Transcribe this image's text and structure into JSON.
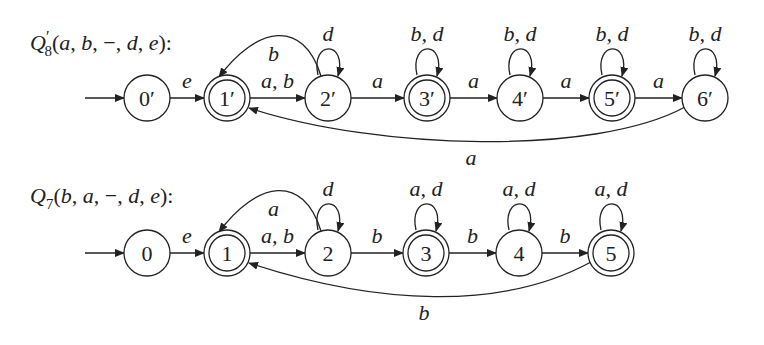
{
  "automata": [
    {
      "id": "top",
      "title": "Q′8(a, b, −, d, e):",
      "title_parts": {
        "name": "Q",
        "sup": "′",
        "sub": "8",
        "args": "(a, b, −, d, e):"
      },
      "title_pos": [
        30,
        50
      ],
      "cy": 98,
      "states": [
        {
          "label": "0′",
          "x": 147,
          "accepting": false,
          "initial": true
        },
        {
          "label": "1′",
          "x": 227,
          "accepting": true,
          "initial": false
        },
        {
          "label": "2′",
          "x": 328,
          "accepting": false,
          "initial": false
        },
        {
          "label": "3′",
          "x": 427,
          "accepting": true,
          "initial": false
        },
        {
          "label": "4′",
          "x": 520,
          "accepting": false,
          "initial": false
        },
        {
          "label": "5′",
          "x": 612,
          "accepting": true,
          "initial": false
        },
        {
          "label": "6′",
          "x": 705,
          "accepting": false,
          "initial": false
        }
      ],
      "transitions": [
        {
          "from": 0,
          "to": 1,
          "label": "e"
        },
        {
          "from": 1,
          "to": 2,
          "label": "a, b"
        },
        {
          "from": 2,
          "to": 3,
          "label": "a"
        },
        {
          "from": 3,
          "to": 4,
          "label": "a"
        },
        {
          "from": 4,
          "to": 5,
          "label": "a"
        },
        {
          "from": 5,
          "to": 6,
          "label": "a"
        }
      ],
      "back_arc_short": {
        "from": 2,
        "to": 1,
        "label": "b"
      },
      "back_arc_long": {
        "from": 6,
        "to": 1,
        "label": "a"
      },
      "self_loops": [
        {
          "state": 2,
          "label": "d"
        },
        {
          "state": 3,
          "label": "b, d"
        },
        {
          "state": 4,
          "label": "b, d"
        },
        {
          "state": 5,
          "label": "b, d"
        },
        {
          "state": 6,
          "label": "b, d"
        }
      ]
    },
    {
      "id": "bottom",
      "title": "Q7(b, a, −, d, e):",
      "title_parts": {
        "name": "Q",
        "sup": "",
        "sub": "7",
        "args": "(b, a, −, d, e):"
      },
      "title_pos": [
        30,
        203
      ],
      "cy": 253,
      "states": [
        {
          "label": "0",
          "x": 147,
          "accepting": false,
          "initial": true
        },
        {
          "label": "1",
          "x": 227,
          "accepting": true,
          "initial": false
        },
        {
          "label": "2",
          "x": 328,
          "accepting": false,
          "initial": false
        },
        {
          "label": "3",
          "x": 426,
          "accepting": true,
          "initial": false
        },
        {
          "label": "4",
          "x": 519,
          "accepting": false,
          "initial": false
        },
        {
          "label": "5",
          "x": 611,
          "accepting": true,
          "initial": false
        }
      ],
      "transitions": [
        {
          "from": 0,
          "to": 1,
          "label": "e"
        },
        {
          "from": 1,
          "to": 2,
          "label": "a, b"
        },
        {
          "from": 2,
          "to": 3,
          "label": "b"
        },
        {
          "from": 3,
          "to": 4,
          "label": "b"
        },
        {
          "from": 4,
          "to": 5,
          "label": "b"
        }
      ],
      "back_arc_short": {
        "from": 2,
        "to": 1,
        "label": "a"
      },
      "back_arc_long": {
        "from": 5,
        "to": 1,
        "label": "b"
      },
      "self_loops": [
        {
          "state": 2,
          "label": "d"
        },
        {
          "state": 3,
          "label": "a, d"
        },
        {
          "state": 4,
          "label": "a, d"
        },
        {
          "state": 5,
          "label": "a, d"
        }
      ]
    }
  ],
  "style": {
    "stroke": "#222222",
    "background": "#ffffff",
    "radius": 23
  }
}
